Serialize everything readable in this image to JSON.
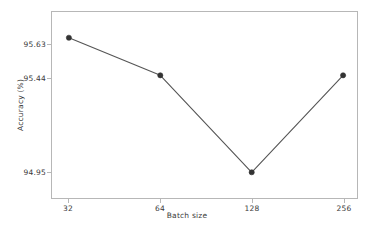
{
  "chart_data": {
    "type": "line",
    "title": "",
    "subtitle": "",
    "xlabel": "Batch size",
    "ylabel": "Accuracy (%)",
    "categories": [
      "32",
      "64",
      "128",
      "256"
    ],
    "values": [
      95.63,
      95.44,
      94.95,
      95.44
    ],
    "series": [
      {
        "name": "Accuracy",
        "values": [
          95.63,
          95.44,
          94.95,
          95.44
        ]
      }
    ],
    "x_tick_labels": [
      "32",
      "64",
      "128",
      "256"
    ],
    "y_tick_labels": [
      "95.63",
      "95.44",
      "94.95"
    ],
    "y_tick_values": [
      95.63,
      95.44,
      94.95
    ],
    "ylim": [
      94.82,
      95.76
    ],
    "xlim": [
      0,
      3
    ],
    "grid": false,
    "legend": false,
    "legend_position": "none",
    "annotations": [],
    "colors": {
      "line": "#555555",
      "marker": "#333333",
      "axis": "#b7b7b7",
      "text": "#3a3a3a",
      "background": "#ffffff"
    }
  },
  "figure": {
    "background": "#ffffff"
  }
}
